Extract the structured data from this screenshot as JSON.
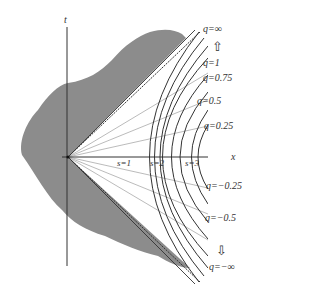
{
  "diagram": {
    "axes": {
      "t_label": "t",
      "x_label": "x"
    },
    "hyperbola_labels": [
      "s=1",
      "s=2",
      "s=3"
    ],
    "q_labels": {
      "q_inf": "q=∞",
      "q_1": "q=1",
      "q_075": "q=0.75",
      "q_05": "q=0.5",
      "q_025": "q=0.25",
      "q_neg025": "q=−0.25",
      "q_neg05": "q=−0.5",
      "q_neg_inf": "q=−∞"
    },
    "arrows": {
      "up": "⇧",
      "down": "⇩"
    },
    "colors": {
      "blob": "#8c8c8c",
      "lines": "#333333",
      "light_lines": "#aaaaaa"
    }
  }
}
